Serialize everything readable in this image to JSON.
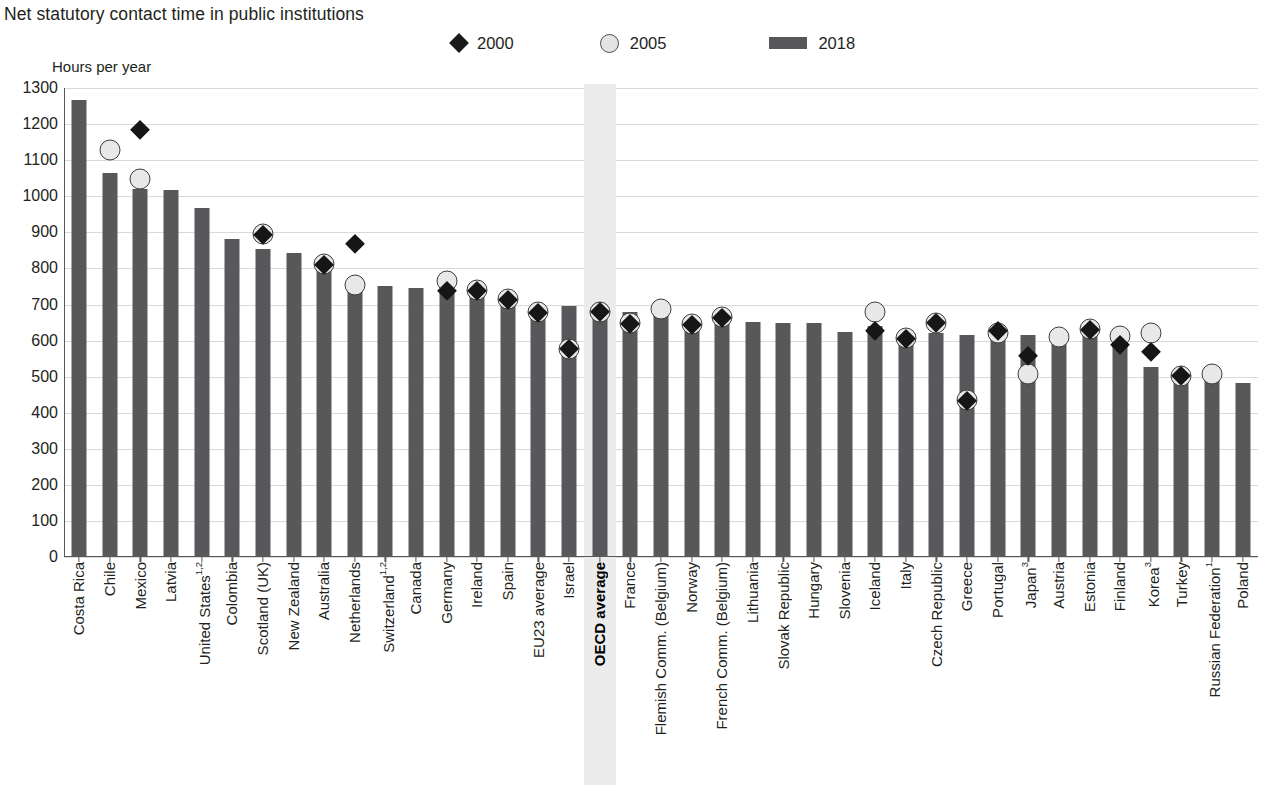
{
  "title": "Net statutory contact time in public institutions",
  "axis_title": "Hours per year",
  "legend": [
    {
      "label": "2000",
      "marker": "diamond-marker",
      "color": "#1a1a1a"
    },
    {
      "label": "2005",
      "marker": "circle-marker",
      "color": "#e3e3e3"
    },
    {
      "label": "2018",
      "marker": "bar-swatch",
      "color": "#58585a"
    }
  ],
  "highlight": {
    "category": "OECD average",
    "band_color": "#ececec"
  },
  "chart_data": {
    "type": "bar",
    "title": "Net statutory contact time in public institutions",
    "xlabel": "",
    "ylabel": "Hours per year",
    "ylim": [
      0,
      1300
    ],
    "ytick_step": 100,
    "yticks": [
      0,
      100,
      200,
      300,
      400,
      500,
      600,
      700,
      800,
      900,
      1000,
      1100,
      1200,
      1300
    ],
    "grid": true,
    "legend_position": "top",
    "categories": [
      "Costa Rica",
      "Chile",
      "Mexico",
      "Latvia",
      "United States",
      "Colombia",
      "Scotland (UK)",
      "New Zealand",
      "Australia",
      "Netherlands",
      "Switzerland",
      "Canada",
      "Germany",
      "Ireland",
      "Spain",
      "EU23 average",
      "Israel",
      "OECD average",
      "France",
      "Flemish Comm. (Belgium)",
      "Norway",
      "French Comm. (Belgium)",
      "Lithuania",
      "Slovak Republic",
      "Hungary",
      "Slovenia",
      "Iceland",
      "Italy",
      "Czech Republic",
      "Greece",
      "Portugal",
      "Japan",
      "Austria",
      "Estonia",
      "Finland",
      "Korea",
      "Turkey",
      "Russian Federation",
      "Poland"
    ],
    "category_labels": [
      "Costa Rica",
      "Chile",
      "Mexico",
      "Latvia",
      "United States¹˒",
      "Colombia",
      "Scotland (UK)",
      "New Zealand",
      "Australia",
      "Netherlands",
      "Switzerland¹˒",
      "Canada",
      "Germany",
      "Ireland",
      "Spain",
      "EU23 average",
      "Israel",
      "OECD average",
      "France",
      "Flemish Comm. (Belgium)",
      "Norway",
      "French Comm. (Belgium)",
      "Lithuania",
      "Slovak Republic",
      "Hungary",
      "Slovenia",
      "Iceland",
      "Italy",
      "Czech Republic",
      "Greece",
      "Portugal",
      "Japan³",
      "Austria",
      "Estonia",
      "Finland",
      "Korea³",
      "Turkey",
      "Russian Federation¹",
      "Poland"
    ],
    "series": [
      {
        "name": "2018",
        "marker": "bar",
        "values": [
          1268,
          1065,
          1020,
          1018,
          968,
          882,
          855,
          842,
          815,
          752,
          750,
          745,
          742,
          733,
          717,
          697,
          695,
          680,
          680,
          682,
          648,
          665,
          652,
          650,
          648,
          623,
          640,
          618,
          622,
          615,
          620,
          615,
          610,
          622,
          602,
          528,
          505,
          508,
          482
        ]
      },
      {
        "name": "2005",
        "marker": "circle",
        "values": [
          null,
          1128,
          1048,
          null,
          null,
          null,
          895,
          null,
          812,
          755,
          null,
          null,
          765,
          740,
          715,
          680,
          578,
          680,
          648,
          688,
          645,
          665,
          null,
          null,
          null,
          null,
          678,
          608,
          650,
          435,
          622,
          508,
          610,
          632,
          612,
          622,
          502,
          508,
          null
        ]
      },
      {
        "name": "2000",
        "marker": "diamond",
        "values": [
          null,
          null,
          1185,
          null,
          null,
          null,
          895,
          null,
          812,
          868,
          null,
          null,
          738,
          740,
          715,
          678,
          578,
          680,
          648,
          null,
          645,
          665,
          null,
          null,
          null,
          null,
          628,
          607,
          650,
          435,
          628,
          558,
          null,
          632,
          588,
          570,
          502,
          null,
          null
        ]
      }
    ]
  }
}
